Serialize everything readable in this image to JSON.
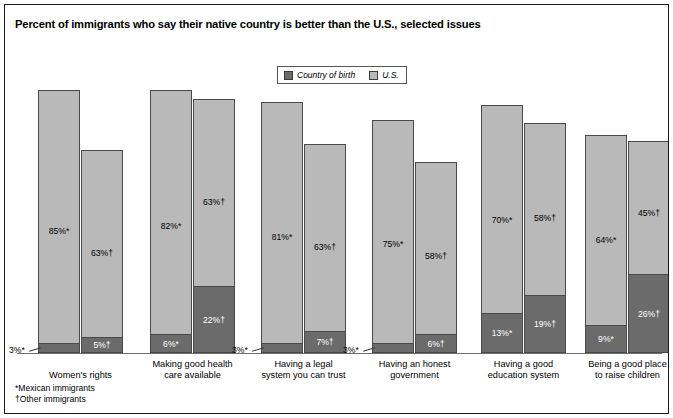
{
  "chart": {
    "title": "Percent of immigrants who say their native country is better than the U.S., selected issues",
    "legend": {
      "birth_label": "Country of birth",
      "us_label": "U.S.",
      "birth_color": "#6b6b6b",
      "us_color": "#b9b9b9"
    },
    "footnotes": {
      "mexican": "*Mexican immigrants",
      "other": "†Other immigrants"
    }
  },
  "chart_data": {
    "type": "bar",
    "title": "Percent of immigrants who say their native country is better than the U.S., selected issues",
    "xlabel": "",
    "ylabel": "",
    "ylim": [
      0,
      90
    ],
    "grid": false,
    "legend_position": "top-center",
    "note": "Stacked bars: dark segment = Country of birth, light segment above = U.S. Two bars per category: * = Mexican immigrants, † = Other immigrants.",
    "categories": [
      "Women's rights",
      "Making good health care available",
      "Having a legal system you can trust",
      "Having an honest government",
      "Having a good education system",
      "Being a good place to raise children"
    ],
    "series": [
      {
        "name": "U.S. — Mexican immigrants",
        "group": "Mexican immigrants",
        "marker": "*",
        "segment": "U.S.",
        "values": [
          85,
          82,
          81,
          75,
          70,
          64
        ],
        "labels": [
          "85%*",
          "82%*",
          "81%*",
          "75%*",
          "70%*",
          "64%*"
        ]
      },
      {
        "name": "Country of birth — Mexican immigrants",
        "group": "Mexican immigrants",
        "marker": "*",
        "segment": "Country of birth",
        "values": [
          3,
          6,
          3,
          3,
          13,
          9
        ],
        "labels": [
          "3%*",
          "6%*",
          "3%*",
          "3%*",
          "13%*",
          "9%*"
        ]
      },
      {
        "name": "U.S. — Other immigrants",
        "group": "Other immigrants",
        "marker": "†",
        "segment": "U.S.",
        "values": [
          63,
          63,
          63,
          58,
          58,
          45
        ],
        "labels": [
          "63%†",
          "63%†",
          "63%†",
          "58%†",
          "58%†",
          "45%†"
        ]
      },
      {
        "name": "Country of birth — Other immigrants",
        "group": "Other immigrants",
        "marker": "†",
        "segment": "Country of birth",
        "values": [
          5,
          22,
          7,
          6,
          19,
          26
        ],
        "labels": [
          "5%†",
          "22%†",
          "7%†",
          "6%†",
          "19%†",
          "26%†"
        ]
      }
    ],
    "groups": [
      {
        "category": "Women's rights",
        "category_lines": [
          "Women's rights"
        ],
        "bars": [
          {
            "marker": "*",
            "us": 85,
            "birth": 3,
            "us_label": "85%*",
            "birth_label": "3%*",
            "birth_label_outside": true
          },
          {
            "marker": "†",
            "us": 63,
            "birth": 5,
            "us_label": "63%†",
            "birth_label": "5%†",
            "birth_label_outside": false
          }
        ]
      },
      {
        "category": "Making good health care available",
        "category_lines": [
          "Making good health",
          "care available"
        ],
        "bars": [
          {
            "marker": "*",
            "us": 82,
            "birth": 6,
            "us_label": "82%*",
            "birth_label": "6%*",
            "birth_label_outside": false
          },
          {
            "marker": "†",
            "us": 63,
            "birth": 22,
            "us_label": "63%†",
            "birth_label": "22%†",
            "birth_label_outside": false
          }
        ]
      },
      {
        "category": "Having a legal system you can trust",
        "category_lines": [
          "Having a legal",
          "system you can trust"
        ],
        "bars": [
          {
            "marker": "*",
            "us": 81,
            "birth": 3,
            "us_label": "81%*",
            "birth_label": "3%*",
            "birth_label_outside": true
          },
          {
            "marker": "†",
            "us": 63,
            "birth": 7,
            "us_label": "63%†",
            "birth_label": "7%†",
            "birth_label_outside": false
          }
        ]
      },
      {
        "category": "Having an honest government",
        "category_lines": [
          "Having an honest",
          "government"
        ],
        "bars": [
          {
            "marker": "*",
            "us": 75,
            "birth": 3,
            "us_label": "75%*",
            "birth_label": "3%*",
            "birth_label_outside": true
          },
          {
            "marker": "†",
            "us": 58,
            "birth": 6,
            "us_label": "58%†",
            "birth_label": "6%†",
            "birth_label_outside": false
          }
        ]
      },
      {
        "category": "Having a good education system",
        "category_lines": [
          "Having a good",
          "education system"
        ],
        "bars": [
          {
            "marker": "*",
            "us": 70,
            "birth": 13,
            "us_label": "70%*",
            "birth_label": "13%*",
            "birth_label_outside": false
          },
          {
            "marker": "†",
            "us": 58,
            "birth": 19,
            "us_label": "58%†",
            "birth_label": "19%†",
            "birth_label_outside": false
          }
        ]
      },
      {
        "category": "Being a good place to raise children",
        "category_lines": [
          "Being a good place",
          "to raise children"
        ],
        "bars": [
          {
            "marker": "*",
            "us": 64,
            "birth": 9,
            "us_label": "64%*",
            "birth_label": "9%*",
            "birth_label_outside": false
          },
          {
            "marker": "†",
            "us": 45,
            "birth": 26,
            "us_label": "45%†",
            "birth_label": "26%†",
            "birth_label_outside": false
          }
        ]
      }
    ]
  }
}
